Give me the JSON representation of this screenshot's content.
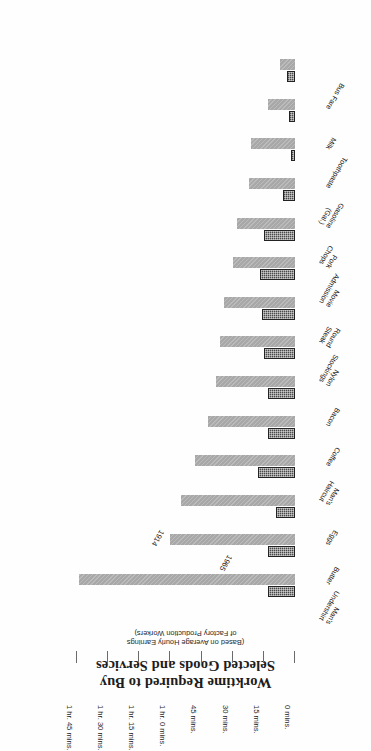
{
  "chart_data": {
    "type": "bar",
    "orientation": "horizontal",
    "title": "Worktime Required to Buy Selected Goods and Services",
    "title_lines": [
      "Worktime Required to Buy",
      "Selected Goods and Services"
    ],
    "subtitle": "(Based on Average Hourly Earnings of Factory Production Workers)",
    "subtitle_lines": [
      "(Based on Average Hourly Earnings",
      "of Factory Production Workers)"
    ],
    "xlabel": "",
    "ylabel": "",
    "xlim": [
      0,
      105
    ],
    "grid": false,
    "legend_position": "inline-annotation",
    "tick_values": [
      105,
      90,
      75,
      60,
      45,
      30,
      15,
      0
    ],
    "tick_labels": [
      "1 hr. 45 mins.",
      "1 hr. 30 mins.",
      "1 hr. 15 mins.",
      "1 hr. 0 mins.",
      "45 mins.",
      "30 mins.",
      "15 mins.",
      "0 mins."
    ],
    "units": "minutes of worktime",
    "categories": [
      "Man's\nUndershirt",
      "Butter",
      "Eggs",
      "Man's\nHaircut",
      "Coffee",
      "Bacon",
      "Nylon\nStockings",
      "Round\nSteak",
      "Movie\nAdmission",
      "Pork\nChops",
      "Gasoline\n(Gal.)",
      "Toothpaste",
      "Milk",
      "Bus Fare"
    ],
    "category_lines": [
      [
        "Man's",
        "Undershirt"
      ],
      [
        "Butter"
      ],
      [
        "Eggs"
      ],
      [
        "Man's",
        "Haircut"
      ],
      [
        "Coffee"
      ],
      [
        "Bacon"
      ],
      [
        "Nylon",
        "Stockings"
      ],
      [
        "Round",
        "Steak"
      ],
      [
        "Movie",
        "Admission"
      ],
      [
        "Pork",
        "Chops"
      ],
      [
        "Gasoline",
        "(Gal.)"
      ],
      [
        "Toothpaste"
      ],
      [
        "Milk"
      ],
      [
        "Bus Fare"
      ]
    ],
    "series": [
      {
        "name": "1914",
        "color": "#a8a8a8",
        "values": [
          104,
          60,
          55,
          48,
          42,
          38,
          36,
          34,
          30,
          28,
          22,
          21,
          13,
          7
        ]
      },
      {
        "name": "1965",
        "color": "#4a4a4a",
        "values": [
          13,
          13,
          9,
          18,
          13,
          13,
          15,
          16,
          17,
          15,
          6,
          2,
          3,
          4
        ]
      }
    ],
    "annotations": [
      {
        "text": "1914",
        "series": "1914"
      },
      {
        "text": "1965",
        "series": "1965"
      }
    ]
  }
}
